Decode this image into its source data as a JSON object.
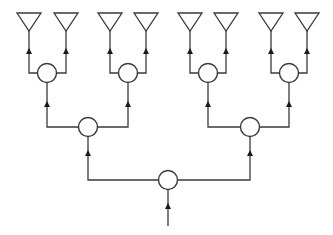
{
  "diagram": {
    "type": "binary-tree-feed-network",
    "colors": {
      "line": "#3a3a3a",
      "arrow": "#1a1a1a",
      "background": "#ffffff"
    },
    "antennas": [
      {
        "id": "a1",
        "x": 29
      },
      {
        "id": "a2",
        "x": 66
      },
      {
        "id": "a3",
        "x": 110
      },
      {
        "id": "a4",
        "x": 146
      },
      {
        "id": "a5",
        "x": 190
      },
      {
        "id": "a6",
        "x": 226
      },
      {
        "id": "a7",
        "x": 271
      },
      {
        "id": "a8",
        "x": 307
      }
    ],
    "level1_nodes": [
      {
        "id": "n1a",
        "x": 47,
        "y": 73
      },
      {
        "id": "n1b",
        "x": 128,
        "y": 73
      },
      {
        "id": "n1c",
        "x": 208,
        "y": 73
      },
      {
        "id": "n1d",
        "x": 289,
        "y": 73
      }
    ],
    "level2_nodes": [
      {
        "id": "n2a",
        "x": 88,
        "y": 127
      },
      {
        "id": "n2b",
        "x": 250,
        "y": 127
      }
    ],
    "root_node": {
      "id": "n3",
      "x": 168,
      "y": 180
    },
    "input_feed": {
      "x": 168,
      "y_end": 226
    },
    "signal_direction": "upward"
  }
}
